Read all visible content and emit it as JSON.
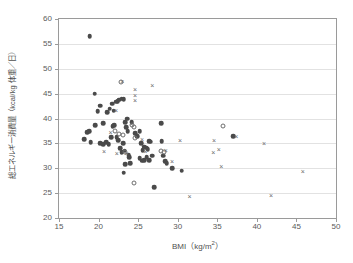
{
  "chart_data": {
    "type": "scatter",
    "title": "",
    "xlabel": "BMI",
    "xlabel_unit": "(kg/m2)",
    "ylabel": "総エネルギー消費量（kcal/kg 体重／日）",
    "xlim": [
      15,
      50
    ],
    "ylim": [
      20,
      60
    ],
    "xticks": [
      15,
      20,
      25,
      30,
      35,
      40,
      45,
      50
    ],
    "yticks": [
      20,
      25,
      30,
      35,
      40,
      45,
      50,
      55,
      60
    ],
    "grid": "horizontal",
    "legend": "none",
    "series": [
      {
        "name": "filled-circle",
        "marker": "filled-circle",
        "color": "#4a4a4a",
        "points": [
          [
            18.9,
            56.6
          ],
          [
            19.5,
            45.0
          ],
          [
            19.9,
            41.5
          ],
          [
            20.2,
            42.6
          ],
          [
            20.6,
            39.0
          ],
          [
            21.1,
            41.3
          ],
          [
            21.4,
            42.0
          ],
          [
            21.7,
            43.0
          ],
          [
            21.9,
            41.6
          ],
          [
            22.2,
            43.4
          ],
          [
            22.4,
            43.5
          ],
          [
            22.6,
            43.8
          ],
          [
            22.9,
            44.0
          ],
          [
            23.2,
            43.9
          ],
          [
            18.2,
            35.8
          ],
          [
            18.6,
            37.2
          ],
          [
            18.8,
            37.4
          ],
          [
            19.0,
            35.2
          ],
          [
            19.6,
            38.7
          ],
          [
            20.2,
            35.0
          ],
          [
            20.6,
            34.8
          ],
          [
            21.0,
            35.2
          ],
          [
            21.3,
            34.8
          ],
          [
            21.6,
            36.3
          ],
          [
            21.8,
            38.4
          ],
          [
            22.0,
            38.7
          ],
          [
            22.3,
            36.2
          ],
          [
            22.5,
            35.6
          ],
          [
            22.7,
            34.0
          ],
          [
            22.9,
            33.2
          ],
          [
            23.1,
            35.0
          ],
          [
            23.3,
            33.5
          ],
          [
            23.4,
            39.3
          ],
          [
            23.5,
            38.2
          ],
          [
            23.6,
            40.0
          ],
          [
            23.7,
            37.5
          ],
          [
            23.8,
            32.6
          ],
          [
            23.9,
            32.2
          ],
          [
            24.0,
            31.0
          ],
          [
            23.2,
            29.1
          ],
          [
            23.4,
            30.8
          ],
          [
            24.2,
            39.3
          ],
          [
            24.6,
            37.0
          ],
          [
            24.9,
            36.5
          ],
          [
            25.2,
            37.5
          ],
          [
            25.4,
            35.0
          ],
          [
            25.6,
            33.6
          ],
          [
            25.8,
            34.3
          ],
          [
            26.0,
            34.1
          ],
          [
            26.2,
            33.8
          ],
          [
            26.4,
            35.4
          ],
          [
            26.6,
            35.3
          ],
          [
            25.2,
            32.0
          ],
          [
            25.5,
            31.5
          ],
          [
            25.8,
            31.6
          ],
          [
            26.1,
            32.2
          ],
          [
            26.4,
            31.6
          ],
          [
            26.8,
            32.5
          ],
          [
            27.0,
            26.2
          ],
          [
            27.9,
            39.0
          ],
          [
            28.0,
            35.4
          ],
          [
            28.2,
            32.5
          ],
          [
            28.4,
            31.4
          ],
          [
            28.6,
            31.0
          ],
          [
            29.3,
            30.0
          ],
          [
            30.5,
            29.5
          ],
          [
            37.0,
            36.5
          ]
        ]
      },
      {
        "name": "open-circle",
        "marker": "open-circle",
        "color": "#6d6d6d",
        "points": [
          [
            22.8,
            47.3
          ],
          [
            22.1,
            37.5
          ],
          [
            22.6,
            36.8
          ],
          [
            23.1,
            36.6
          ],
          [
            24.5,
            38.3
          ],
          [
            24.2,
            38.7
          ],
          [
            24.6,
            36.1
          ],
          [
            23.3,
            33.2
          ],
          [
            24.5,
            27.0
          ],
          [
            27.9,
            33.5
          ],
          [
            28.3,
            33.2
          ],
          [
            35.7,
            38.5
          ]
        ]
      },
      {
        "name": "cross",
        "marker": "cross",
        "color": "#6a6a6a",
        "points": [
          [
            23.0,
            47.4
          ],
          [
            24.6,
            45.8
          ],
          [
            24.6,
            44.6
          ],
          [
            24.6,
            43.5
          ],
          [
            26.8,
            46.5
          ],
          [
            22.2,
            41.5
          ],
          [
            21.5,
            37.1
          ],
          [
            20.7,
            33.3
          ],
          [
            23.5,
            32.9
          ],
          [
            22.3,
            32.8
          ],
          [
            25.5,
            35.7
          ],
          [
            25.9,
            33.3
          ],
          [
            28.5,
            33.4
          ],
          [
            29.3,
            31.2
          ],
          [
            30.3,
            35.5
          ],
          [
            31.5,
            24.2
          ],
          [
            34.6,
            35.5
          ],
          [
            34.5,
            33.0
          ],
          [
            35.2,
            33.6
          ],
          [
            35.5,
            30.3
          ],
          [
            37.4,
            36.3
          ],
          [
            40.9,
            34.9
          ],
          [
            41.8,
            24.4
          ],
          [
            45.8,
            29.3
          ]
        ]
      }
    ]
  },
  "axes": {
    "x_title_main": "BMI",
    "x_title_unit_open": "（kg/m",
    "x_title_unit_exp": "2",
    "x_title_unit_close": "）",
    "y_title": "総エネルギー消費量（kcal/kg 体重／日）"
  },
  "caption": {
    "text": ""
  }
}
